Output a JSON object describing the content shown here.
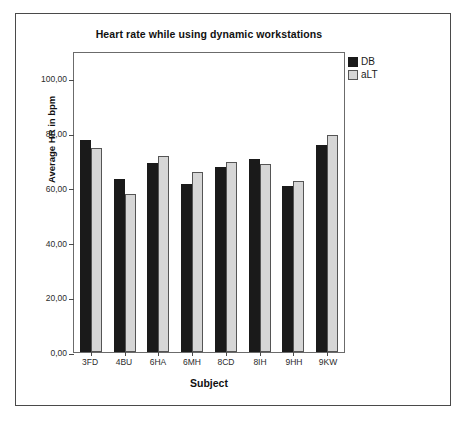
{
  "figure": {
    "title": "Heart rate while using dynamic workstations"
  },
  "axes": {
    "xlabel": "Subject",
    "ylabel": "Average HR in bpm",
    "y_ticks": [
      "0,00",
      "20,00",
      "40,00",
      "60,00",
      "80,00",
      "100,00"
    ],
    "x_ticks": [
      "3FD",
      "4BU",
      "6HA",
      "6MH",
      "8CD",
      "8IH",
      "9HH",
      "9KW"
    ]
  },
  "legend": {
    "items": [
      {
        "label": "DB",
        "color": "#1a1a1a"
      },
      {
        "label": "aLT",
        "color": "#d6d6d6"
      }
    ]
  },
  "chart_data": {
    "type": "bar",
    "title": "Heart rate while using dynamic workstations",
    "xlabel": "Subject",
    "ylabel": "Average HR in bpm",
    "ylim": [
      0,
      110
    ],
    "ytick_values": [
      0,
      20,
      40,
      60,
      80,
      100
    ],
    "ytick_labels": [
      "0,00",
      "20,00",
      "40,00",
      "60,00",
      "80,00",
      "100,00"
    ],
    "grid": false,
    "legend_position": "top-right-outside",
    "categories": [
      "3FD",
      "4BU",
      "6HA",
      "6MH",
      "8CD",
      "8IH",
      "9HH",
      "9KW"
    ],
    "series": [
      {
        "name": "DB",
        "color": "#1a1a1a",
        "values": [
          77.4,
          63.4,
          69.1,
          61.5,
          67.5,
          70.6,
          60.8,
          75.5
        ]
      },
      {
        "name": "aLT",
        "color": "#d6d6d6",
        "values": [
          74.7,
          57.7,
          71.7,
          65.7,
          69.4,
          68.7,
          62.6,
          79.2
        ]
      }
    ]
  }
}
